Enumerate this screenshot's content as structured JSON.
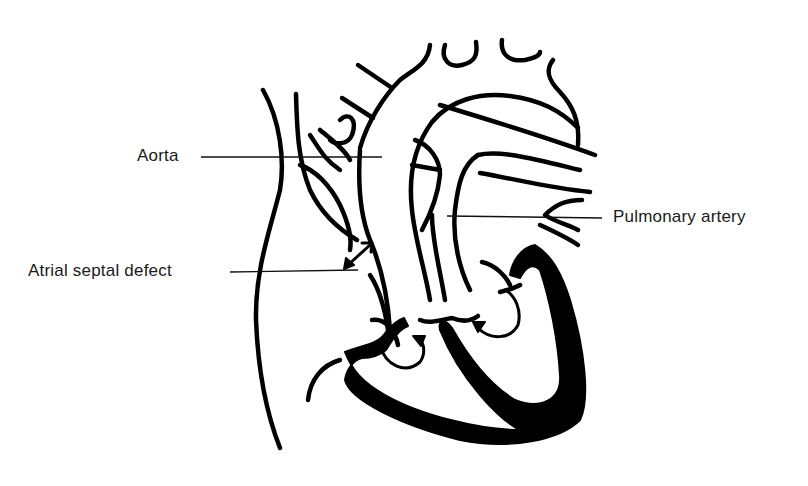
{
  "figure": {
    "labels": [
      {
        "id": "aorta",
        "text": "Aorta",
        "x": 137,
        "y": 146
      },
      {
        "id": "atrial-septal-defect",
        "text": "Atrial septal defect",
        "x": 28,
        "y": 261
      },
      {
        "id": "pulmonary-artery",
        "text": "Pulmonary artery",
        "x": 613,
        "y": 207
      }
    ],
    "colors": {
      "line": "#000000",
      "background": "#ffffff",
      "text": "#1a1a1a"
    }
  }
}
